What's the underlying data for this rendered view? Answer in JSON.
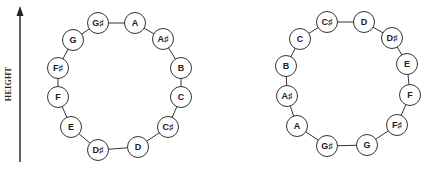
{
  "axis": {
    "label": "HEIGHT",
    "x": 20,
    "y_top": 6,
    "y_bottom": 162,
    "color": "#222222"
  },
  "style": {
    "stroke": "#333333",
    "node_fill": "#ffffff",
    "node_radius": 10.5
  },
  "helices": [
    {
      "id": "left",
      "nodes": [
        {
          "label": "G♯",
          "x": 98,
          "y": 23
        },
        {
          "label": "A",
          "x": 135,
          "y": 23
        },
        {
          "label": "A♯",
          "x": 163,
          "y": 39
        },
        {
          "label": "B",
          "x": 181,
          "y": 68
        },
        {
          "label": "C",
          "x": 181,
          "y": 97
        },
        {
          "label": "C♯",
          "x": 168,
          "y": 127
        },
        {
          "label": "D",
          "x": 138,
          "y": 147
        },
        {
          "label": "D♯",
          "x": 98,
          "y": 150
        },
        {
          "label": "E",
          "x": 71,
          "y": 127
        },
        {
          "label": "F",
          "x": 58,
          "y": 97
        },
        {
          "label": "F♯",
          "x": 58,
          "y": 68
        },
        {
          "label": "G",
          "x": 73,
          "y": 40
        }
      ]
    },
    {
      "id": "right",
      "nodes": [
        {
          "label": "C♯",
          "x": 327,
          "y": 22
        },
        {
          "label": "D",
          "x": 364,
          "y": 22
        },
        {
          "label": "D♯",
          "x": 392,
          "y": 38
        },
        {
          "label": "E",
          "x": 407,
          "y": 64
        },
        {
          "label": "F",
          "x": 410,
          "y": 95
        },
        {
          "label": "F♯",
          "x": 397,
          "y": 125
        },
        {
          "label": "G",
          "x": 367,
          "y": 145
        },
        {
          "label": "G♯",
          "x": 327,
          "y": 146
        },
        {
          "label": "A",
          "x": 297,
          "y": 126
        },
        {
          "label": "A♯",
          "x": 287,
          "y": 96
        },
        {
          "label": "B",
          "x": 286,
          "y": 66
        },
        {
          "label": "C",
          "x": 300,
          "y": 39
        }
      ]
    }
  ]
}
